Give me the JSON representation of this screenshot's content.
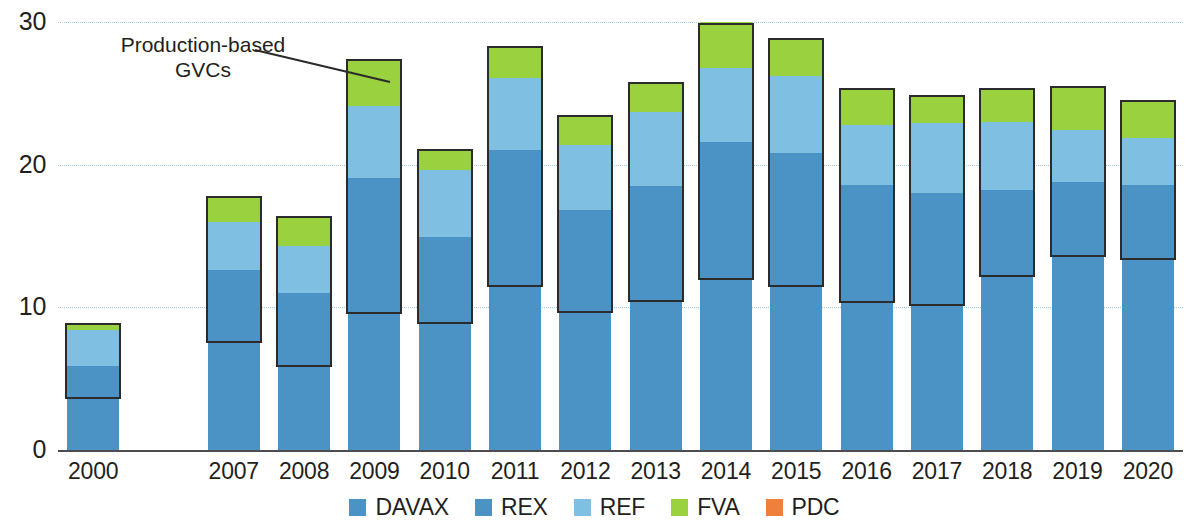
{
  "chart_data": {
    "type": "bar",
    "subtype": "stacked",
    "title": "",
    "xlabel": "",
    "ylabel": "",
    "ylim": [
      0,
      30
    ],
    "yticks": [
      0,
      10,
      20,
      30
    ],
    "ytick_labels": [
      "0",
      "10",
      "20",
      "30"
    ],
    "grid": true,
    "grid_axis": "y",
    "legend_position": "bottom",
    "categories": [
      "2000",
      "2007",
      "2008",
      "2009",
      "2010",
      "2011",
      "2012",
      "2013",
      "2014",
      "2015",
      "2016",
      "2017",
      "2018",
      "2019",
      "2020"
    ],
    "series": [
      {
        "name": "DAVAX",
        "color": "#4a93c4",
        "values": [
          3.6,
          7.5,
          5.8,
          9.5,
          8.8,
          11.4,
          9.6,
          10.4,
          11.9,
          11.4,
          10.3,
          10.1,
          12.1,
          13.5,
          13.3
        ]
      },
      {
        "name": "REX",
        "color": "#4a93c4",
        "values": [
          2.3,
          5.1,
          5.2,
          9.6,
          6.1,
          9.6,
          7.2,
          8.1,
          9.7,
          9.4,
          8.3,
          7.9,
          6.1,
          5.3,
          5.3
        ]
      },
      {
        "name": "REF",
        "color": "#7fc0e2",
        "values": [
          2.5,
          3.4,
          3.3,
          5.0,
          4.7,
          5.1,
          4.6,
          5.2,
          5.2,
          5.4,
          4.2,
          4.9,
          4.8,
          3.6,
          3.3
        ]
      },
      {
        "name": "FVA",
        "color": "#99d13f",
        "values": [
          0.5,
          1.8,
          2.1,
          3.3,
          1.5,
          2.2,
          2.1,
          2.1,
          3.2,
          2.7,
          2.6,
          2.0,
          2.4,
          3.1,
          2.6
        ]
      },
      {
        "name": "PDC",
        "color": "#f07f3c",
        "values": [
          0,
          0,
          0,
          0,
          0,
          0,
          0,
          0,
          0,
          0,
          0,
          0,
          0,
          0,
          0
        ]
      }
    ],
    "totals": [
      8.9,
      17.8,
      16.4,
      27.4,
      21.1,
      28.3,
      23.5,
      25.8,
      29.9,
      28.9,
      25.4,
      24.9,
      25.4,
      25.5,
      24.5
    ],
    "gvc_box": {
      "label": "Production-based GVCs",
      "description": "Outlined box spanning REX + REF + FVA segments of each bar",
      "lower": [
        3.6,
        7.5,
        5.8,
        9.5,
        8.8,
        11.4,
        9.6,
        10.4,
        11.9,
        11.4,
        10.3,
        10.1,
        12.1,
        13.5,
        13.3
      ],
      "upper": [
        8.9,
        17.8,
        16.4,
        27.4,
        21.1,
        28.3,
        23.5,
        25.8,
        29.9,
        28.9,
        25.4,
        24.9,
        25.4,
        25.5,
        24.5
      ]
    },
    "annotation": {
      "line1": "Production-based",
      "line2": "GVCs",
      "points_to": "2009"
    },
    "legend": [
      {
        "label": "DAVAX",
        "color": "#4a93c4"
      },
      {
        "label": "REX",
        "color": "#4a93c4"
      },
      {
        "label": "REF",
        "color": "#7fc0e2"
      },
      {
        "label": "FVA",
        "color": "#99d13f"
      },
      {
        "label": "PDC",
        "color": "#f07f3c"
      }
    ],
    "colors": {
      "davax": "#4a93c4",
      "rex": "#4a93c4",
      "ref": "#7fc0e2",
      "fva": "#99d13f",
      "pdc": "#f07f3c",
      "grid": "#9ecbe0",
      "axis": "#4d4d4f",
      "box_outline": "#2b2b2b",
      "text": "#231f20"
    },
    "gap_after_category": "2000"
  }
}
